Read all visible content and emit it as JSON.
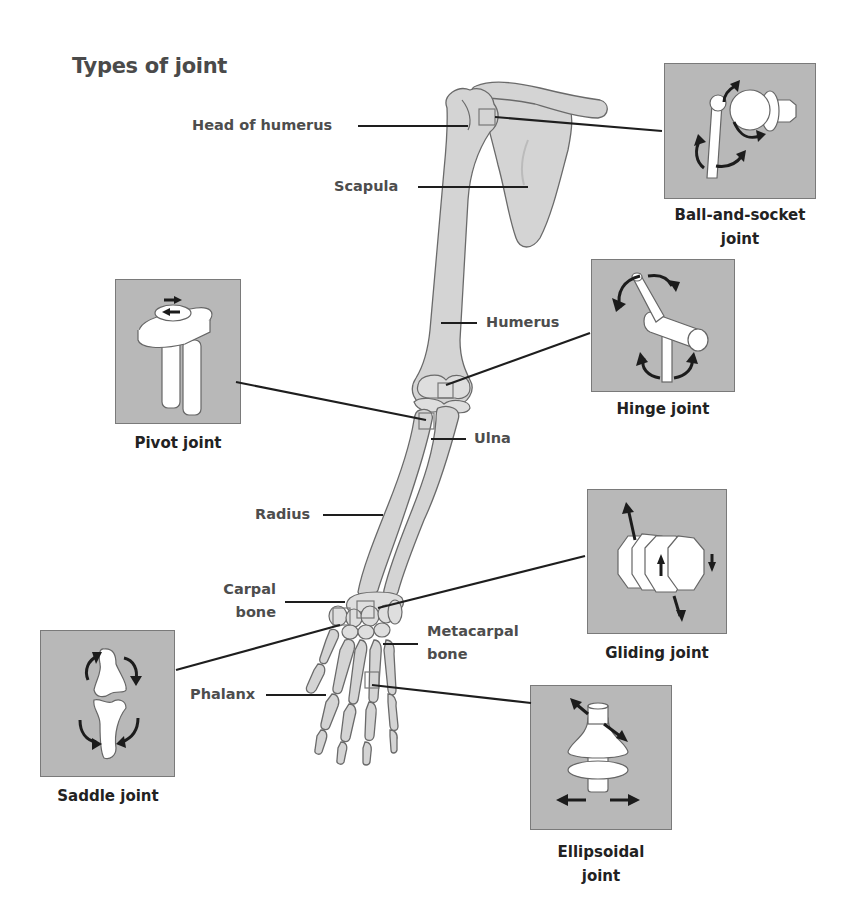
{
  "title": "Types of joint",
  "bone_labels": {
    "head_of_humerus": "Head of humerus",
    "scapula": "Scapula",
    "humerus": "Humerus",
    "ulna": "Ulna",
    "radius": "Radius",
    "carpal_bone_line1": "Carpal",
    "carpal_bone_line2": "bone",
    "metacarpal_bone_line1": "Metacarpal",
    "metacarpal_bone_line2": "bone",
    "phalanx": "Phalanx"
  },
  "joints": {
    "ball_and_socket": {
      "line1": "Ball-and-socket",
      "line2": "joint",
      "icon": "ball-and-socket-joint-icon"
    },
    "hinge": {
      "line1": "Hinge joint",
      "icon": "hinge-joint-icon"
    },
    "pivot": {
      "line1": "Pivot joint",
      "icon": "pivot-joint-icon"
    },
    "gliding": {
      "line1": "Gliding joint",
      "icon": "gliding-joint-icon"
    },
    "saddle": {
      "line1": "Saddle joint",
      "icon": "saddle-joint-icon"
    },
    "ellipsoidal": {
      "line1": "Ellipsoidal",
      "line2": "joint",
      "icon": "ellipsoidal-joint-icon"
    }
  },
  "colors": {
    "bone_fill": "#d4d4d4",
    "panel_fill": "#b8b8b8",
    "leader_line": "#1e1e1e",
    "text": "#4d4d4d"
  }
}
